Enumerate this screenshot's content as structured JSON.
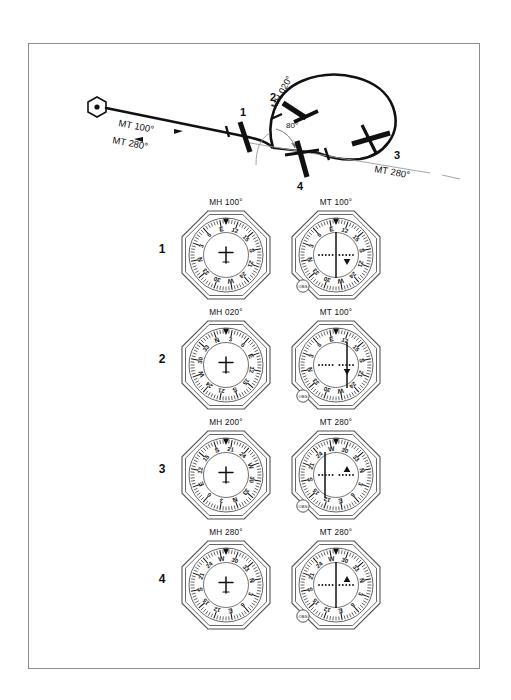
{
  "diagram": {
    "title_alt": "VOR holding pattern entry — magnetic heading vs magnetic track",
    "station_symbol": "vor-hexagon",
    "labels": {
      "outbound": "MT 100°",
      "inbound": "MT 280°",
      "turn_heading": "MH 020°",
      "radial": "MT 280°",
      "angle": "80°"
    },
    "waypoints": [
      "1",
      "2",
      "3",
      "4"
    ]
  },
  "instrument_rows": [
    {
      "number": "1",
      "left": {
        "caption": "MH 100°",
        "type": "compass",
        "heading": 100,
        "knob": null
      },
      "right": {
        "caption": "MT 100°",
        "type": "vor",
        "heading": 100,
        "cdi_offset": 0,
        "flag": "from",
        "knob": "OBS"
      }
    },
    {
      "number": "2",
      "left": {
        "caption": "MH 020°",
        "type": "compass",
        "heading": 20,
        "knob": null
      },
      "right": {
        "caption": "MT 100°",
        "type": "vor",
        "heading": 100,
        "cdi_offset": 11,
        "flag": "from",
        "knob": "OBS"
      }
    },
    {
      "number": "3",
      "left": {
        "caption": "MH 200°",
        "type": "compass",
        "heading": 200,
        "knob": null
      },
      "right": {
        "caption": "MT 280°",
        "type": "vor",
        "heading": 280,
        "cdi_offset": -11,
        "flag": "to",
        "knob": "OBS"
      }
    },
    {
      "number": "4",
      "left": {
        "caption": "MH 280°",
        "type": "compass",
        "heading": 280,
        "knob": null
      },
      "right": {
        "caption": "MT 280°",
        "type": "vor",
        "heading": 280,
        "cdi_offset": 0,
        "flag": "to",
        "knob": "OBS"
      }
    }
  ],
  "compass_card": {
    "cardinals": {
      "0": "N",
      "90": "E",
      "180": "S",
      "270": "W"
    },
    "numerals": [
      "3",
      "6",
      "12",
      "15",
      "21",
      "24",
      "30",
      "33"
    ],
    "index_marker": "top-pointer-triangle"
  },
  "colors": {
    "ink": "#111111",
    "frame": "#8d8d8d",
    "paper": "#ffffff"
  }
}
